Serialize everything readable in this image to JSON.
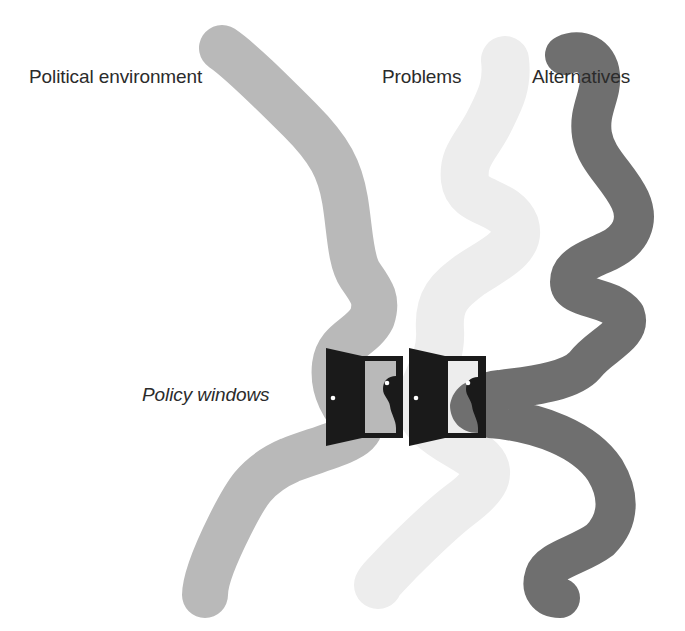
{
  "diagram": {
    "streams": [
      {
        "id": "political",
        "label": "Political environment",
        "color": "#b9b9b9"
      },
      {
        "id": "problems",
        "label": "Problems",
        "color": "#ededed"
      },
      {
        "id": "alternatives",
        "label": "Alternatives",
        "color": "#6f6f6f"
      }
    ],
    "windows": {
      "label": "Policy windows",
      "count": 2,
      "door_color": "#1a1a1a",
      "knob_color": "#ffffff"
    },
    "colors": {
      "background": "#ffffff",
      "text": "#2b2b2b"
    }
  }
}
